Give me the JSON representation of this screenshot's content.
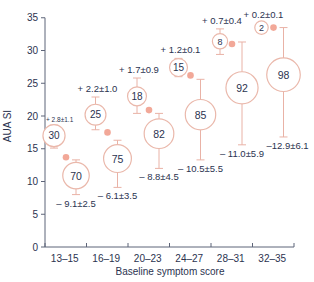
{
  "chart_data": {
    "type": "bubble-scatter",
    "title": "",
    "xlabel": "Baseline symptom score",
    "ylabel": "AUA SI",
    "ylim": [
      0,
      35
    ],
    "yticks": [
      0,
      5,
      10,
      15,
      20,
      25,
      30,
      35
    ],
    "categories": [
      "13–15",
      "16–19",
      "20–23",
      "24–27",
      "28–31",
      "32–35"
    ],
    "grid": false,
    "series": [
      {
        "name": "Worsened (% of patients)",
        "percent": [
          30,
          25,
          18,
          15,
          8,
          2
        ],
        "mean": [
          17.0,
          20.2,
          23.0,
          27.4,
          31.4,
          33.5
        ],
        "err_top": [
          18.6,
          22.9,
          25.8,
          28.8,
          33.3,
          34.2
        ],
        "err_bottom": [
          15.1,
          17.9,
          20.4,
          26.0,
          29.4,
          33.2
        ],
        "labels": [
          "+ 2.8±1.1",
          "+ 2.2±1.0",
          "+ 1.7±0.9",
          "+ 1.2±0.1",
          "+ 0.7±0.4",
          "+ 0.2±0.1"
        ]
      },
      {
        "name": "Improved (% of patients)",
        "percent": [
          70,
          75,
          82,
          85,
          92,
          98
        ],
        "mean": [
          10.9,
          13.5,
          17.3,
          20.2,
          24.3,
          26.3
        ],
        "err_top": [
          13.3,
          16.3,
          20.4,
          25.6,
          31.3,
          33.5
        ],
        "err_bottom": [
          8.0,
          9.1,
          12.0,
          13.3,
          15.6,
          16.8
        ],
        "labels": [
          "– 9.1±2.5",
          "– 6.1±3.5",
          "– 8.8±4.5",
          "– 10.5±5.5",
          "– 11.0±5.9",
          "–12.9±6.1"
        ]
      },
      {
        "name": "Baseline mean",
        "mean": [
          13.7,
          17.5,
          20.9,
          26.2,
          31.0,
          33.5
        ]
      }
    ]
  },
  "colors": {
    "bubble_stroke": "#eab8ab",
    "error_bar": "#e9b2a6",
    "baseline_dot": "#f2a898",
    "axis": "#5d6478",
    "text": "#2b3350"
  }
}
